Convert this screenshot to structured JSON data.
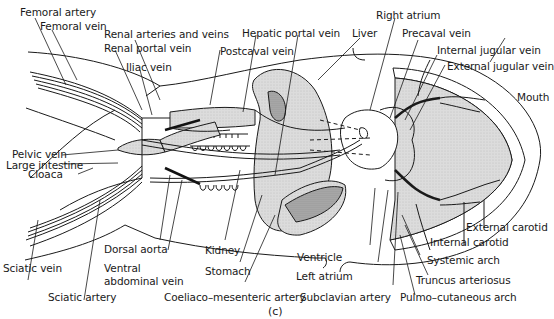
{
  "figure": {
    "caption": "(c)",
    "colors": {
      "outline": "#1a1a1a",
      "organ_fill": "#d9d9d9",
      "organ_dark": "#a8a8a8",
      "background": "#ffffff"
    }
  },
  "labels": {
    "femoral_artery": "Femoral artery",
    "femoral_vein": "Femoral vein",
    "renal_arteries_veins": "Renal arteries and veins",
    "renal_portal_vein": "Renal portal vein",
    "iliac_vein": "Iliac vein",
    "hepatic_portal_vein": "Hepatic portal vein",
    "postcaval_vein": "Postcaval vein",
    "liver": "Liver",
    "right_atrium": "Right atrium",
    "precaval_vein": "Precaval vein",
    "internal_jugular_vein": "Internal jugular vein",
    "external_jugular_vein": "External jugular vein",
    "mouth": "Mouth",
    "pelvic_vein": "Pelvic vein",
    "cloaca": "Cloaca",
    "large_intestine": "Large intestine",
    "sciatic_vein": "Sciatic vein",
    "sciatic_artery": "Sciatic artery",
    "dorsal_aorta": "Dorsal aorta",
    "ventral_abdominal_vein": "Ventral\nabdominal vein",
    "kidney": "Kidney",
    "stomach": "Stomach",
    "coeliaco_mesenteric_artery": "Coeliaco–mesenteric artery",
    "ventricle": "Ventricle",
    "left_atrium": "Left atrium",
    "subclavian_artery": "Subclavian artery",
    "external_carotid": "External carotid",
    "internal_carotid": "Internal carotid",
    "systemic_arch": "Systemic arch",
    "truncus_arteriosus": "Truncus arteriosus",
    "pulmo_cutaneous_arch": "Pulmo–cutaneous arch"
  }
}
